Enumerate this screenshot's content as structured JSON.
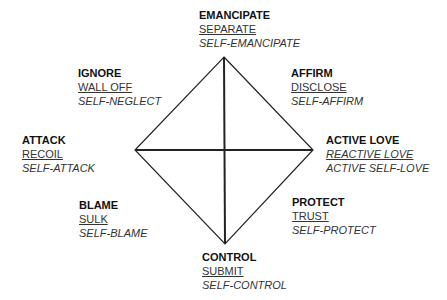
{
  "diagram": {
    "geometry": {
      "top": [
        224,
        57
      ],
      "bottom": [
        225,
        244
      ],
      "left": [
        135,
        150
      ],
      "right": [
        313,
        150
      ],
      "center": [
        225,
        150
      ]
    },
    "line_color": "#222222",
    "nodes": {
      "emancipate": {
        "title": "EMANCIPATE",
        "reactive": "SEPARATE",
        "self": "SELF-EMANCIPATE"
      },
      "ignore": {
        "title": "IGNORE",
        "reactive": "WALL OFF",
        "self": "SELF-NEGLECT"
      },
      "affirm": {
        "title": "AFFIRM",
        "reactive": "DISCLOSE",
        "self": "SELF-AFFIRM"
      },
      "attack": {
        "title": "ATTACK",
        "reactive": "RECOIL",
        "self": "SELF-ATTACK"
      },
      "active_love": {
        "title": "ACTIVE LOVE",
        "reactive": "REACTIVE LOVE",
        "self": "ACTIVE SELF-LOVE"
      },
      "blame": {
        "title": "BLAME",
        "reactive": "SULK",
        "self": "SELF-BLAME"
      },
      "protect": {
        "title": "PROTECT",
        "reactive": "TRUST",
        "self": "SELF-PROTECT"
      },
      "control": {
        "title": "CONTROL",
        "reactive": "SUBMIT",
        "self": "SELF-CONTROL"
      }
    }
  }
}
